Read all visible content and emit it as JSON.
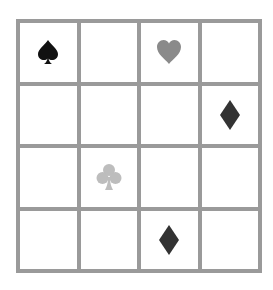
{
  "board": {
    "rows": 4,
    "cols": 4,
    "grid_color": "#9a9a9a",
    "cells": [
      [
        {
          "symbol": "spade",
          "color": "#111111"
        },
        {
          "symbol": "",
          "color": ""
        },
        {
          "symbol": "heart",
          "color": "#8a8a8a"
        },
        {
          "symbol": "",
          "color": ""
        }
      ],
      [
        {
          "symbol": "",
          "color": ""
        },
        {
          "symbol": "",
          "color": ""
        },
        {
          "symbol": "",
          "color": ""
        },
        {
          "symbol": "diamond",
          "color": "#333333"
        }
      ],
      [
        {
          "symbol": "",
          "color": ""
        },
        {
          "symbol": "club",
          "color": "#bdbdbd"
        },
        {
          "symbol": "",
          "color": ""
        },
        {
          "symbol": "",
          "color": ""
        }
      ],
      [
        {
          "symbol": "",
          "color": ""
        },
        {
          "symbol": "",
          "color": ""
        },
        {
          "symbol": "diamond",
          "color": "#333333"
        },
        {
          "symbol": "",
          "color": ""
        }
      ]
    ]
  }
}
